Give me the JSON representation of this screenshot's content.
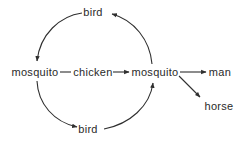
{
  "diagram": {
    "type": "transmission-cycle",
    "nodes": {
      "bird_top": {
        "label": "bird",
        "x": 93,
        "y": 16
      },
      "mosquito_left": {
        "label": "mosquito",
        "x": 35,
        "y": 76
      },
      "chicken": {
        "label": "chicken",
        "x": 93,
        "y": 76
      },
      "mosquito_right": {
        "label": "mosquito",
        "x": 155,
        "y": 76
      },
      "bird_bottom": {
        "label": "bird",
        "x": 88,
        "y": 133
      },
      "man": {
        "label": "man",
        "x": 220,
        "y": 76
      },
      "horse": {
        "label": "horse",
        "x": 219,
        "y": 110
      }
    },
    "edges": [
      {
        "from": "bird_top",
        "to": "mosquito_left",
        "style": "curved-arrow"
      },
      {
        "from": "mosquito_left",
        "to": "bird_bottom",
        "style": "curved-arrow"
      },
      {
        "from": "bird_bottom",
        "to": "mosquito_right",
        "style": "curved-arrow"
      },
      {
        "from": "mosquito_right",
        "to": "bird_top",
        "style": "curved-arrow"
      },
      {
        "from": "mosquito_left",
        "to": "chicken",
        "style": "line"
      },
      {
        "from": "chicken",
        "to": "mosquito_right",
        "style": "arrow"
      },
      {
        "from": "mosquito_right",
        "to": "man",
        "style": "arrow"
      },
      {
        "from": "mosquito_right",
        "to": "horse",
        "style": "arrow"
      }
    ],
    "colors": {
      "stroke": "#2f2f2f",
      "text": "#2a2a2a",
      "background": "#ffffff"
    }
  }
}
